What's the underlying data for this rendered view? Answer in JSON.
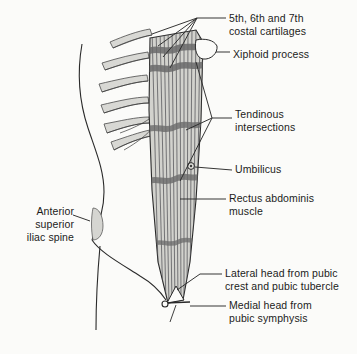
{
  "figure": {
    "background_color": "#fbfbf9",
    "ink_color": "#1b1b1b",
    "muscle_fill_color": "#cfcfcb",
    "tendinous_band_color": "#6e6e6e",
    "cartilage_fill_color": "#d8d8d4"
  },
  "labels": [
    {
      "id": "costal-cartilages",
      "text": "5th, 6th and 7th\ncostal cartilages",
      "side": "right",
      "x": 229,
      "y": 12
    },
    {
      "id": "xiphoid-process",
      "text": "Xiphoid process",
      "side": "right",
      "x": 233,
      "y": 48
    },
    {
      "id": "tendinous-intersections",
      "text": "Tendinous\nintersections",
      "side": "right",
      "x": 235,
      "y": 108
    },
    {
      "id": "umbilicus",
      "text": "Umbilicus",
      "side": "right",
      "x": 235,
      "y": 168
    },
    {
      "id": "rectus-abdominis-muscle",
      "text": "Rectus abdominis\nmuscle",
      "side": "right",
      "x": 229,
      "y": 192
    },
    {
      "id": "lateral-head",
      "text": "Lateral head from pubic\ncrest and pubic tubercle",
      "side": "right",
      "x": 225,
      "y": 268
    },
    {
      "id": "medial-head",
      "text": "Medial head from\npubic symphysis",
      "side": "right",
      "x": 229,
      "y": 300
    },
    {
      "id": "anterior-superior-iliac-spine",
      "text": "Anterior\nsuperior\niliac spine",
      "side": "left",
      "x": 22,
      "y": 208
    }
  ],
  "structures": {
    "muscle_fiber_count": 14,
    "tendinous_intersection_count": 4,
    "costal_cartilage_count": 6,
    "umbilicus_marker": "small-circle",
    "pubic_attachment_marker": "small-circle"
  }
}
